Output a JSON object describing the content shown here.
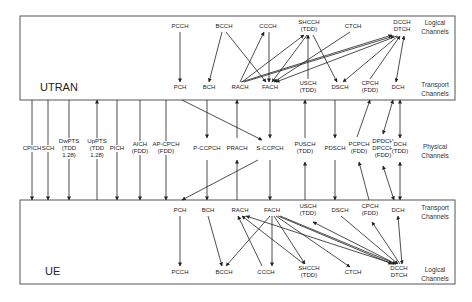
{
  "utran": {
    "title": "UTRAN",
    "logical_label": [
      "Logical",
      "Channels"
    ],
    "transport_label": [
      "Transport",
      "Channels"
    ],
    "logical": [
      {
        "id": "pcch",
        "lines": [
          "PCCH"
        ],
        "x": 180,
        "y": 26
      },
      {
        "id": "bcch",
        "lines": [
          "BCCH"
        ],
        "x": 224,
        "y": 26
      },
      {
        "id": "ccch",
        "lines": [
          "CCCH"
        ],
        "x": 268,
        "y": 26
      },
      {
        "id": "shcch",
        "lines": [
          "SHCCH",
          "(TDD)"
        ],
        "x": 309,
        "y": 22
      },
      {
        "id": "ctch",
        "lines": [
          "CTCH"
        ],
        "x": 353,
        "y": 26
      },
      {
        "id": "dcch",
        "lines": [
          "DCCH",
          "DTCH"
        ],
        "x": 402,
        "y": 22
      }
    ],
    "transport": [
      {
        "id": "pch",
        "lines": [
          "PCH"
        ],
        "x": 180,
        "y": 87
      },
      {
        "id": "bch",
        "lines": [
          "BCH"
        ],
        "x": 209,
        "y": 87
      },
      {
        "id": "rach",
        "lines": [
          "RACH"
        ],
        "x": 240,
        "y": 87
      },
      {
        "id": "fach",
        "lines": [
          "FACH"
        ],
        "x": 270,
        "y": 87
      },
      {
        "id": "usch",
        "lines": [
          "USCH",
          "(TDD)"
        ],
        "x": 308,
        "y": 83
      },
      {
        "id": "dsch",
        "lines": [
          "DSCH"
        ],
        "x": 340,
        "y": 87
      },
      {
        "id": "cpch",
        "lines": [
          "CPCH",
          "(FDD)"
        ],
        "x": 370,
        "y": 83
      },
      {
        "id": "dch",
        "lines": [
          "DCH"
        ],
        "x": 398,
        "y": 87
      }
    ]
  },
  "physical": {
    "label": [
      "Physical",
      "Channels"
    ],
    "channels": [
      {
        "id": "cpich",
        "lines": [
          "CPICH"
        ],
        "x": 32,
        "dir": "down"
      },
      {
        "id": "sch",
        "lines": [
          "SCH"
        ],
        "x": 48,
        "dir": "down"
      },
      {
        "id": "dwpts",
        "lines": [
          "DwPTS",
          "(TDD",
          "1.28)"
        ],
        "x": 69,
        "dir": "down"
      },
      {
        "id": "uppts",
        "lines": [
          "UpPTS",
          "(TDD",
          "1.28)"
        ],
        "x": 97,
        "dir": "up"
      },
      {
        "id": "pich",
        "lines": [
          "PICH"
        ],
        "x": 117,
        "dir": "down"
      },
      {
        "id": "aich",
        "lines": [
          "AICH",
          "(FDD)"
        ],
        "x": 140,
        "dir": "down"
      },
      {
        "id": "apcpch",
        "lines": [
          "AP-CPCH",
          "(FDD)"
        ],
        "x": 166,
        "dir": "down"
      },
      {
        "id": "pccpch",
        "lines": [
          "P-CCPCH"
        ],
        "x": 207,
        "dir": "down"
      },
      {
        "id": "prach",
        "lines": [
          "PRACH"
        ],
        "x": 237,
        "dir": "up"
      },
      {
        "id": "sccpch",
        "lines": [
          "S-CCPCH"
        ],
        "x": 270,
        "dir": "down"
      },
      {
        "id": "pusch",
        "lines": [
          "PUSCH",
          "(TDD)"
        ],
        "x": 305,
        "dir": "up"
      },
      {
        "id": "pdsch",
        "lines": [
          "PDSCH"
        ],
        "x": 335,
        "dir": "down"
      },
      {
        "id": "pcpch",
        "lines": [
          "PCPCH",
          "(FDD)"
        ],
        "x": 359,
        "dir": "up"
      },
      {
        "id": "dpdch",
        "lines": [
          "DPDCH",
          "DPCCH",
          "(FDD)"
        ],
        "x": 383,
        "dir": "both"
      },
      {
        "id": "dch_tdd",
        "lines": [
          "DCH",
          "(TDD)"
        ],
        "x": 400,
        "dir": "both"
      }
    ]
  },
  "ue": {
    "title": "UE",
    "transport_label": [
      "Transport",
      "Channels"
    ],
    "logical_label": [
      "Logical",
      "Channels"
    ],
    "transport": [
      {
        "id": "pch",
        "lines": [
          "PCH"
        ],
        "x": 180,
        "y": 210
      },
      {
        "id": "bch",
        "lines": [
          "BCH"
        ],
        "x": 208,
        "y": 210
      },
      {
        "id": "rach",
        "lines": [
          "RACH"
        ],
        "x": 240,
        "y": 210
      },
      {
        "id": "fach",
        "lines": [
          "FACH"
        ],
        "x": 272,
        "y": 210
      },
      {
        "id": "usch",
        "lines": [
          "USCH",
          "(TDD)"
        ],
        "x": 308,
        "y": 206
      },
      {
        "id": "dsch",
        "lines": [
          "DSCH"
        ],
        "x": 340,
        "y": 210
      },
      {
        "id": "cpch",
        "lines": [
          "CPCH",
          "(FDD)"
        ],
        "x": 370,
        "y": 206
      },
      {
        "id": "dch",
        "lines": [
          "DCH"
        ],
        "x": 398,
        "y": 210
      }
    ],
    "logical": [
      {
        "id": "pcch",
        "lines": [
          "PCCH"
        ],
        "x": 180,
        "y": 272
      },
      {
        "id": "bcch",
        "lines": [
          "BCCH"
        ],
        "x": 224,
        "y": 272
      },
      {
        "id": "ccch",
        "lines": [
          "CCCH"
        ],
        "x": 266,
        "y": 272
      },
      {
        "id": "shcch",
        "lines": [
          "SHCCH",
          "(TDD)"
        ],
        "x": 309,
        "y": 268
      },
      {
        "id": "ctch",
        "lines": [
          "CTCH"
        ],
        "x": 353,
        "y": 272
      },
      {
        "id": "dcch",
        "lines": [
          "DCCH",
          "DTCH"
        ],
        "x": 399,
        "y": 268
      }
    ]
  }
}
